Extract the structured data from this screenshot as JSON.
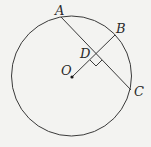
{
  "diagram": {
    "type": "geometry-circle",
    "circle": {
      "cx": 71.5,
      "cy": 76,
      "r": 60
    },
    "points": {
      "A": {
        "label": "A",
        "x": 61,
        "y": 17
      },
      "B": {
        "label": "B",
        "x": 115,
        "y": 34
      },
      "C": {
        "label": "C",
        "x": 131,
        "y": 90
      },
      "D": {
        "label": "D",
        "x": 96,
        "y": 54
      },
      "O": {
        "label": "O",
        "x": 72,
        "y": 77
      }
    },
    "segments": [
      "AC",
      "OB"
    ],
    "annotations": [
      "right-angle at D between OB and AC",
      "O is center of circle"
    ],
    "colors": {
      "stroke": "#3a3a3a",
      "background": "#f3f3f1"
    }
  }
}
